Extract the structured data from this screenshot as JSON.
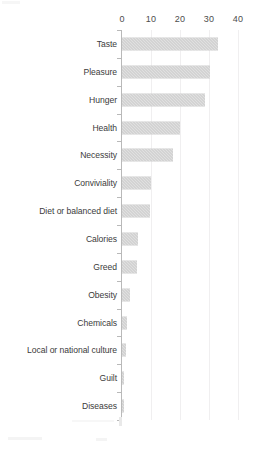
{
  "chart_data": {
    "type": "bar",
    "orientation": "horizontal",
    "title": "",
    "subtitle": "",
    "xlabel": "",
    "ylabel": "",
    "xlim": [
      0,
      40
    ],
    "xticks": [
      0,
      10,
      20,
      30,
      40
    ],
    "xtick_labels": [
      "0",
      "10",
      "20",
      "30",
      "40"
    ],
    "grid": true,
    "grid_axis": "x",
    "legend": false,
    "legend_position": "none",
    "bar_color": "#c6c6c6",
    "bar_pattern": "hatched",
    "axis_color": "#b9b9b9",
    "text_color": "#3b3b3b",
    "categories": [
      "Taste",
      "Pleasure",
      "Hunger",
      "Health",
      "Necessity",
      "Conviviality",
      "Diet or balanced diet",
      "Calories",
      "Greed",
      "Obesity",
      "Chemicals",
      "Local or national culture",
      "Guilt",
      "Diseases"
    ],
    "values": [
      33,
      30.5,
      28.5,
      20,
      17.5,
      10,
      9.5,
      5.5,
      5,
      2.7,
      1.8,
      1.5,
      0.8,
      0.5
    ]
  },
  "axis": {
    "ticks": [
      {
        "label": "0",
        "value": 0
      },
      {
        "label": "10",
        "value": 10
      },
      {
        "label": "20",
        "value": 20
      },
      {
        "label": "30",
        "value": 30
      },
      {
        "label": "40",
        "value": 40
      }
    ]
  }
}
